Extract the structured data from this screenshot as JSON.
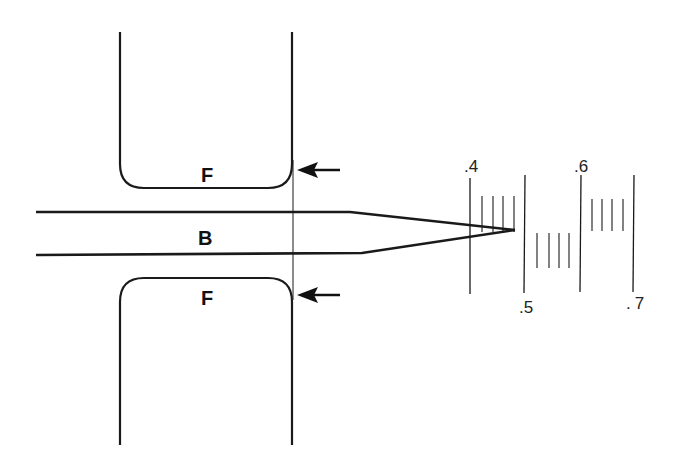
{
  "diagram": {
    "type": "mechanical-schematic",
    "colors": {
      "line": "#1a1a1a",
      "background": "#ffffff"
    },
    "labels": {
      "upper_block": "F",
      "beam": "B",
      "lower_block": "F"
    },
    "arrows": [
      {
        "name": "upper-arrow",
        "direction": "left"
      },
      {
        "name": "lower-arrow",
        "direction": "left"
      }
    ],
    "scale": {
      "ticks": [
        {
          "label": ".4"
        },
        {
          "label": ".5"
        },
        {
          "label": ".6"
        },
        {
          "label": ".7"
        }
      ],
      "minor_ticks_per_interval": 4
    }
  }
}
